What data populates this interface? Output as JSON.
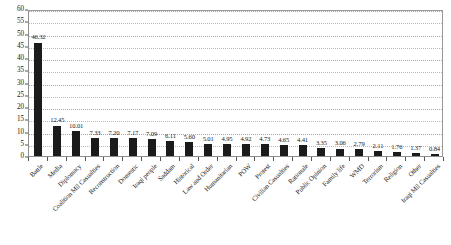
{
  "chart_data": {
    "type": "bar",
    "title": "",
    "subtitle": "",
    "xlabel": "",
    "ylabel": "",
    "ylim": [
      0,
      60
    ],
    "ytick_step": 5,
    "grid": true,
    "legend": false,
    "legend_position": "none",
    "bar_color": "#1b1b1b",
    "categories": [
      "Battle",
      "Media",
      "Diplomacy",
      "Coalition Mil Casualties",
      "Reconstruction",
      "Domestic",
      "Iraqi people",
      "Saddam",
      "Historical",
      "Law and Order",
      "Humanitarian",
      "POW",
      "Protest",
      "Civilian Casualties",
      "Rationale",
      "Public Opinion",
      "Family life",
      "WMD",
      "Terrorism",
      "Religion",
      "Other",
      "Iraqi Mil Casualties"
    ],
    "values": [
      46.32,
      12.45,
      10.01,
      7.33,
      7.2,
      7.17,
      7.09,
      6.11,
      5.6,
      5.01,
      4.95,
      4.92,
      4.73,
      4.65,
      4.41,
      3.35,
      3.06,
      2.79,
      2.11,
      1.76,
      1.37,
      0.84
    ],
    "value_labels": [
      "46.32",
      "12.45",
      "10.01",
      "7.33",
      "7.20",
      "7.17",
      "7.09",
      "6.11",
      "5.60",
      "5.01",
      "4.95",
      "4.92",
      "4.73",
      "4.65",
      "4.41",
      "3.35",
      "3.06",
      "2.79",
      "2.11",
      "1.76",
      "1.37",
      "0.84"
    ],
    "ytick_labels": [
      "0",
      "5",
      "10",
      "15",
      "20",
      "25",
      "30",
      "35",
      "40",
      "45",
      "50",
      "55",
      "60"
    ]
  }
}
